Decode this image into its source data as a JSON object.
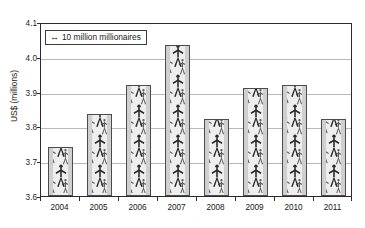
{
  "caption_remnant": "Figure 1.  Global average wealth per millionaire household, 2004-2011, in US$ millions",
  "legend": {
    "arrow_icon": "left-right-arrow-icon",
    "label": "10 million millionaires"
  },
  "chart_data": {
    "type": "bar",
    "title": "",
    "xlabel": "",
    "ylabel": "US$ (millions)",
    "categories": [
      "2004",
      "2005",
      "2006",
      "2007",
      "2008",
      "2009",
      "2010",
      "2011"
    ],
    "values": [
      3.74,
      3.835,
      3.92,
      4.035,
      3.82,
      3.91,
      3.92,
      3.82
    ],
    "ylim": [
      3.6,
      4.1
    ],
    "yticks": [
      3.6,
      3.7,
      3.8,
      3.9,
      4.0,
      4.1
    ],
    "ytick_labels": [
      "3.6",
      "3.7",
      "3.8",
      "3.9",
      "4.0",
      "4.1"
    ],
    "grid": true,
    "legend_position": "top-left",
    "bar_fill": "human-figure-pictogram-pattern",
    "annotations": [
      "10 million millionaires"
    ],
    "colors": {
      "bar_fill": "#eeeeee",
      "bar_edge": "#4c4c4c",
      "bar_side": "#cfcfcf",
      "gridline": "#b9b9b9",
      "axis": "#2b2b2b"
    }
  }
}
